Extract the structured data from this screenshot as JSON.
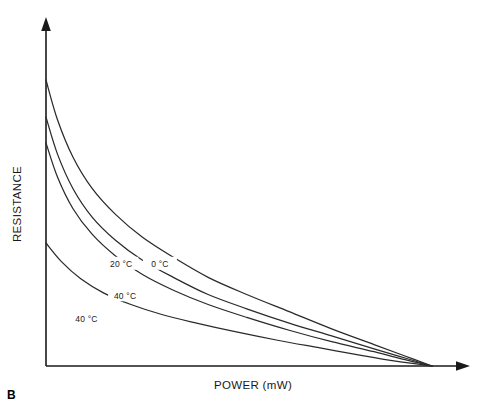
{
  "panel": {
    "label": "B"
  },
  "chart_data": {
    "type": "line",
    "title": "",
    "subtitle": "",
    "xlabel": "POWER (mW)",
    "ylabel": "RESISTANCE",
    "grid": false,
    "legend_position": "inline-labels",
    "annotations": [
      "B"
    ],
    "axis": {
      "x_ticks": [],
      "y_ticks": [],
      "x_arrow": true,
      "y_arrow": true,
      "xlim": [
        0,
        1
      ],
      "ylim": [
        0,
        1
      ],
      "note": "Qualitative axes: no numeric tick labels shown"
    },
    "series": [
      {
        "name": "0 °C",
        "label": "0 °C",
        "label_x": 0.295,
        "label_y": 0.345,
        "x": [
          0.0,
          0.03,
          0.07,
          0.12,
          0.18,
          0.25,
          0.33,
          0.42,
          0.52,
          0.63,
          0.74,
          0.85,
          0.93,
          1.0
        ],
        "y": [
          1.0,
          0.86,
          0.73,
          0.62,
          0.53,
          0.45,
          0.38,
          0.31,
          0.25,
          0.19,
          0.13,
          0.075,
          0.035,
          0.0
        ]
      },
      {
        "name": "20 °C",
        "label": "20 °C",
        "label_x": 0.195,
        "label_y": 0.345,
        "x": [
          0.0,
          0.03,
          0.07,
          0.12,
          0.18,
          0.25,
          0.33,
          0.42,
          0.52,
          0.63,
          0.74,
          0.85,
          0.93,
          1.0
        ],
        "y": [
          0.87,
          0.74,
          0.62,
          0.52,
          0.44,
          0.37,
          0.31,
          0.25,
          0.2,
          0.15,
          0.105,
          0.06,
          0.028,
          0.0
        ]
      },
      {
        "name": "40 °C (upper)",
        "label": "40 °C",
        "label_x": 0.205,
        "label_y": 0.235,
        "x": [
          0.0,
          0.03,
          0.07,
          0.12,
          0.18,
          0.25,
          0.33,
          0.42,
          0.52,
          0.63,
          0.74,
          0.85,
          0.93,
          1.0
        ],
        "y": [
          0.78,
          0.66,
          0.55,
          0.46,
          0.385,
          0.32,
          0.265,
          0.215,
          0.17,
          0.125,
          0.085,
          0.05,
          0.022,
          0.0
        ]
      },
      {
        "name": "40 °C (lower)",
        "label": "40 °C",
        "label_x": 0.105,
        "label_y": 0.155,
        "x": [
          0.0,
          0.04,
          0.09,
          0.15,
          0.22,
          0.3,
          0.39,
          0.49,
          0.6,
          0.71,
          0.82,
          0.91,
          1.0
        ],
        "y": [
          0.43,
          0.365,
          0.305,
          0.255,
          0.215,
          0.18,
          0.15,
          0.12,
          0.09,
          0.063,
          0.036,
          0.016,
          0.0
        ]
      }
    ]
  }
}
